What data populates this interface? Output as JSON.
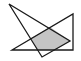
{
  "diagram": {
    "background": "#ffffff",
    "stroke_color": "#1a1a1a",
    "fill_color": "#c4c4c4",
    "triangle_a": {
      "points": "9,4 42,57 70,41"
    },
    "triangle_b": {
      "points": "12,50 73,14 73,50"
    },
    "overlap_region": {
      "points": "31,38 50,27 70,41 55,50 37,50"
    }
  }
}
